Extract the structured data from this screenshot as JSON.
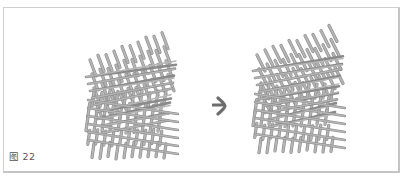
{
  "figure": {
    "caption": "图 22",
    "arrow_icon": "right-arrow",
    "left_image": "bamboo-lattice-structure-before",
    "right_image": "bamboo-lattice-structure-after",
    "colors": {
      "stick": "#b5b5b5",
      "stick_dark": "#8a8a8a",
      "arrow": "#6d6d6d",
      "border": "#cfcfcf"
    }
  }
}
